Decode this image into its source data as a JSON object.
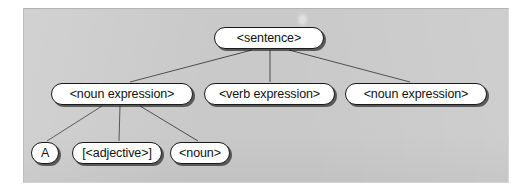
{
  "figure": {
    "kind": "parse-tree-diagram",
    "panel": {
      "background_color": "#c9c9c9",
      "border_color": "#b5b5b5"
    },
    "node_style": {
      "fill_color": "#ffffff",
      "stroke_color": "#1a1a1a",
      "text_color": "#111111",
      "shadow_color": "#141414",
      "shape": "rounded-pill"
    },
    "edge_style": {
      "stroke_color": "#4a4a4a"
    }
  },
  "tree": {
    "root": {
      "id": "sentence",
      "label": "<sentence>"
    },
    "level2": [
      {
        "id": "noun-expression-1",
        "label": "<noun expression>"
      },
      {
        "id": "verb-expression",
        "label": "<verb expression>"
      },
      {
        "id": "noun-expression-2",
        "label": "<noun expression>"
      }
    ],
    "level3": [
      {
        "id": "terminal-a",
        "label": "A"
      },
      {
        "id": "adjective",
        "label": "[<adjective>]"
      },
      {
        "id": "noun",
        "label": "<noun>"
      }
    ]
  },
  "marks": {
    "smudge": {
      "left": 297,
      "top": 13
    }
  }
}
